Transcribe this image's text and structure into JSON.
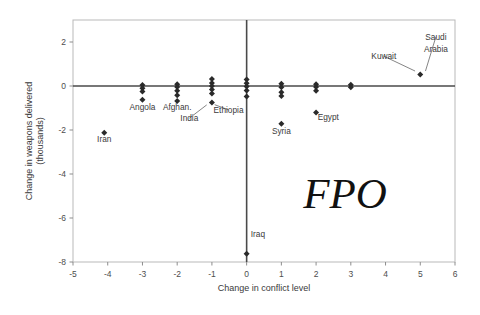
{
  "chart_data": {
    "type": "scatter",
    "title": "",
    "xlabel": "Change in conflict level",
    "ylabel": "Change in weapons delivered (thousands)",
    "ylabel_lines": [
      "Change in weapons delivered",
      "(thousands)"
    ],
    "xlim": [
      -5,
      6
    ],
    "ylim": [
      -8,
      3
    ],
    "xticks": [
      -5,
      -4,
      -3,
      -2,
      -1,
      0,
      1,
      2,
      3,
      4,
      5,
      6
    ],
    "xticklabels": [
      "-5",
      "-4",
      "-3",
      "-2",
      "-1",
      "0",
      "1",
      "2",
      "3",
      "4",
      "5",
      "6"
    ],
    "yticks": [
      2,
      0,
      -2,
      -4,
      -6,
      -8
    ],
    "yticklabels": [
      "2",
      "0",
      "-2",
      "-4",
      "-6",
      "-8"
    ],
    "grid": false,
    "legend": "none",
    "zero_line_y": 0,
    "zero_line_x": 0,
    "marker": "diamond",
    "points": [
      {
        "x": -4.1,
        "y": -2.12,
        "label": "Iran"
      },
      {
        "x": -3.0,
        "y": 0.05
      },
      {
        "x": -3.0,
        "y": -0.1
      },
      {
        "x": -3.0,
        "y": -0.25
      },
      {
        "x": -3.0,
        "y": -0.62,
        "label": "Angola"
      },
      {
        "x": -2.0,
        "y": 0.08
      },
      {
        "x": -2.0,
        "y": -0.05
      },
      {
        "x": -2.0,
        "y": -0.22
      },
      {
        "x": -2.0,
        "y": -0.42
      },
      {
        "x": -2.0,
        "y": -0.68,
        "label": "Afghan."
      },
      {
        "x": -1.0,
        "y": 0.32
      },
      {
        "x": -1.0,
        "y": 0.14
      },
      {
        "x": -1.0,
        "y": 0.0
      },
      {
        "x": -1.0,
        "y": -0.16
      },
      {
        "x": -1.0,
        "y": -0.34
      },
      {
        "x": -1.0,
        "y": -0.75,
        "label": "Ethiopia"
      },
      {
        "x": 0.0,
        "y": 0.3
      },
      {
        "x": 0.0,
        "y": 0.12
      },
      {
        "x": 0.0,
        "y": -0.02
      },
      {
        "x": 0.0,
        "y": -0.2
      },
      {
        "x": 0.0,
        "y": -0.48
      },
      {
        "x": 0.0,
        "y": -7.62,
        "label": "Iraq"
      },
      {
        "x": 1.0,
        "y": 0.1
      },
      {
        "x": 1.0,
        "y": -0.06
      },
      {
        "x": 1.0,
        "y": -0.28
      },
      {
        "x": 1.0,
        "y": -0.46
      },
      {
        "x": 1.0,
        "y": -1.72,
        "label": "Syria"
      },
      {
        "x": 2.0,
        "y": 0.08
      },
      {
        "x": 2.0,
        "y": -0.05
      },
      {
        "x": 2.0,
        "y": -0.22
      },
      {
        "x": 2.0,
        "y": -1.2,
        "label": "Egypt"
      },
      {
        "x": 3.0,
        "y": 0.06
      },
      {
        "x": 3.0,
        "y": -0.06
      },
      {
        "x": 5.0,
        "y": 0.52,
        "label": "Saudi Arabia"
      }
    ],
    "annotations": [
      {
        "text": "Iran",
        "x": -4.1,
        "y": -2.55,
        "anchor": "middle",
        "leader": false
      },
      {
        "text": "Angola",
        "x": -3.0,
        "y": -1.1,
        "anchor": "middle",
        "leader": false
      },
      {
        "text": "Afghan.",
        "x": -2.0,
        "y": -1.1,
        "anchor": "middle",
        "leader": false
      },
      {
        "text": "India",
        "x": -1.65,
        "y": -1.6,
        "anchor": "middle",
        "leader": true,
        "to_x": -1.15,
        "to_y": -0.86
      },
      {
        "text": "Ethiopia",
        "x": -0.52,
        "y": -1.22,
        "anchor": "middle",
        "leader": true,
        "to_x": -0.92,
        "to_y": -0.85
      },
      {
        "text": "Iraq",
        "x": 0.12,
        "y": -6.85,
        "anchor": "start",
        "leader": false
      },
      {
        "text": "Syria",
        "x": 1.0,
        "y": -2.2,
        "anchor": "middle",
        "leader": false
      },
      {
        "text": "Egypt",
        "x": 2.35,
        "y": -1.55,
        "anchor": "middle",
        "leader": false
      },
      {
        "text": "Kuwait",
        "x": 3.95,
        "y": 1.22,
        "anchor": "middle",
        "leader": true,
        "to_x": 4.85,
        "to_y": 0.68
      },
      {
        "text": "Saudi",
        "x": 5.45,
        "y": 2.1,
        "anchor": "middle",
        "leader": true,
        "to_x": 5.15,
        "to_y": 0.68
      },
      {
        "text": "Arabia",
        "x": 5.45,
        "y": 1.55,
        "anchor": "middle",
        "leader": false
      }
    ],
    "watermark": "FPO"
  }
}
